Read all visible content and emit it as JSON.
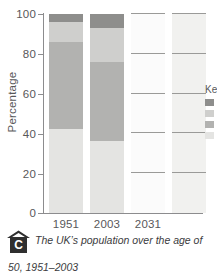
{
  "figure": {
    "badge": "C",
    "caption_line1": "The UK’s population over the age of",
    "caption_line2": "50, 1951–2003"
  },
  "chart_data": {
    "type": "bar",
    "stacked": true,
    "title": "",
    "xlabel": "",
    "ylabel": "Percentage",
    "ylim": [
      0,
      100
    ],
    "yticks": [
      0,
      20,
      40,
      60,
      80,
      100
    ],
    "grid": false,
    "categories": [
      "1951",
      "2003",
      "2031",
      ""
    ],
    "series": [
      {
        "name": "Under 50",
        "color": "#e4e4e2",
        "values": [
          42,
          36,
          0,
          0
        ]
      },
      {
        "name": "50–64",
        "color": "#b2b2b0",
        "values": [
          44,
          40,
          0,
          0
        ]
      },
      {
        "name": "65–79",
        "color": "#d2d2d0",
        "values": [
          10,
          17,
          0,
          0
        ]
      },
      {
        "name": "80 and over",
        "color": "#8e8e8c",
        "values": [
          4,
          7,
          0,
          0
        ]
      }
    ],
    "bar_segments": [
      {
        "category": "1951",
        "segments": [
          {
            "label": "Under 50",
            "from": 0,
            "to": 42,
            "color": "#e4e4e2"
          },
          {
            "label": "50–64",
            "from": 42,
            "to": 86,
            "color": "#b2b2b0"
          },
          {
            "label": "65–79",
            "from": 86,
            "to": 96,
            "color": "#cfcfcd"
          },
          {
            "label": "80 and over",
            "from": 96,
            "to": 100,
            "color": "#8e8e8c"
          }
        ]
      },
      {
        "category": "2003",
        "segments": [
          {
            "label": "Under 50",
            "from": 0,
            "to": 36,
            "color": "#e4e4e2"
          },
          {
            "label": "50–64",
            "from": 36,
            "to": 76,
            "color": "#b2b2b0"
          },
          {
            "label": "65–79",
            "from": 76,
            "to": 93,
            "color": "#cfcfcd"
          },
          {
            "label": "80 and over",
            "from": 93,
            "to": 100,
            "color": "#8e8e8c"
          }
        ]
      },
      {
        "category": "2031",
        "segments": [
          {
            "label": "Under 50",
            "from": 0,
            "to": 100,
            "color": "#fbfbfb"
          }
        ]
      },
      {
        "category": "",
        "segments": [
          {
            "label": "Under 50",
            "from": 0,
            "to": 100,
            "color": "#f1f1ef"
          }
        ]
      }
    ],
    "legend": {
      "position": "right",
      "title": "Key",
      "entries": [
        {
          "label": "",
          "color": "#8e8e8c"
        },
        {
          "label": "",
          "color": "#cfcfcd"
        },
        {
          "label": "",
          "color": "#b2b2b0"
        },
        {
          "label": "",
          "color": "#e4e4e2"
        }
      ]
    },
    "ytick_labels": [
      "0",
      "20",
      "40",
      "60",
      "80",
      "100"
    ],
    "xtick_labels": [
      "1951",
      "2003",
      "2031"
    ]
  }
}
